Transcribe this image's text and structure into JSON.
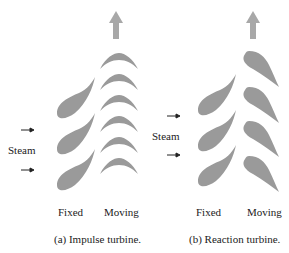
{
  "colors": {
    "blade": "#9a9a9a",
    "arrow": "#a8a8a8",
    "text": "#222222"
  },
  "impulse": {
    "steam_label": "Steam",
    "fixed_label": "Fixed",
    "moving_label": "Moving",
    "caption": "(a) Impulse turbine.",
    "fixed_blades": 3,
    "moving_blades": 6,
    "flow_icon": "up-arrow-icon"
  },
  "reaction": {
    "steam_label": "Steam",
    "fixed_label": "Fixed",
    "moving_label": "Moving",
    "caption": "(b) Reaction turbine.",
    "fixed_blades": 3,
    "moving_blades": 4,
    "flow_icon": "up-arrow-icon"
  }
}
